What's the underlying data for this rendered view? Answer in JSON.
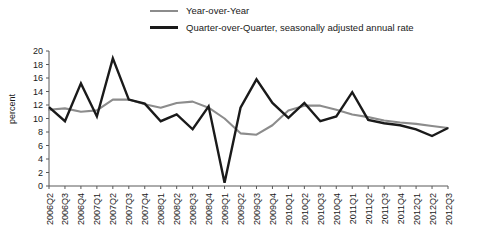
{
  "legend": {
    "position": "top-center",
    "items": [
      {
        "label": "Year-over-Year",
        "key": "yoy",
        "color": "#8c8c8c"
      },
      {
        "label": "Quarter-over-Quarter, seasonally adjusted annual rate",
        "key": "qoq",
        "color": "#1a1a1a"
      }
    ]
  },
  "axis": {
    "ylabel": "percent",
    "yticks": [
      0,
      2,
      4,
      6,
      8,
      10,
      12,
      14,
      16,
      18,
      20
    ]
  },
  "chart_data": {
    "type": "line",
    "title": "",
    "subtitle": "",
    "xlabel": "",
    "ylabel": "percent",
    "ylim": [
      0,
      20
    ],
    "ytick_step": 2,
    "grid": false,
    "legend_position": "top-center",
    "categories": [
      "2006Q2",
      "2006Q3",
      "2006Q4",
      "2007Q1",
      "2007Q2",
      "2007Q3",
      "2007Q4",
      "2008Q1",
      "2008Q2",
      "2008Q3",
      "2008Q4",
      "2009Q1",
      "2009Q2",
      "2009Q3",
      "2009Q4",
      "2010Q1",
      "2010Q2",
      "2010Q3",
      "2010Q4",
      "2011Q1",
      "2011Q2",
      "2011Q3",
      "2011Q4",
      "2012Q1",
      "2012Q2",
      "2012Q3"
    ],
    "series": [
      {
        "name": "Year-over-Year",
        "color": "#8c8c8c",
        "values": [
          11.3,
          11.5,
          11.0,
          11.2,
          12.8,
          12.8,
          12.1,
          11.6,
          12.3,
          12.5,
          11.6,
          10.0,
          7.8,
          7.6,
          9.0,
          11.2,
          11.9,
          11.9,
          11.3,
          10.6,
          10.2,
          9.7,
          9.4,
          9.2,
          8.9,
          8.6
        ]
      },
      {
        "name": "Quarter-over-Quarter, seasonally adjusted annual rate",
        "color": "#1a1a1a",
        "values": [
          11.7,
          9.6,
          15.2,
          10.3,
          18.9,
          12.8,
          12.2,
          9.6,
          10.6,
          8.4,
          11.8,
          0.5,
          11.6,
          15.8,
          12.3,
          10.1,
          12.3,
          9.6,
          10.3,
          13.9,
          9.8,
          9.3,
          9.0,
          8.4,
          7.4,
          8.6
        ]
      }
    ]
  }
}
